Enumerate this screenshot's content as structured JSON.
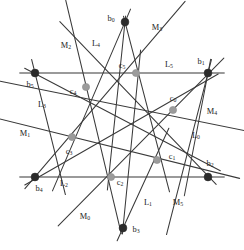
{
  "figure": {
    "colors": {
      "background": "#ffffff",
      "dark_line": "#3a3a3a",
      "gray_line": "#9a9a9a",
      "black_node": "#2b2b2b",
      "gray_node": "#9b9b9b",
      "label_text": "#232323"
    },
    "width": 244,
    "height": 250
  },
  "black_points": [
    {
      "id": "b0",
      "base": "b",
      "sub": "0",
      "x": 125,
      "y": 22,
      "label_x": 111,
      "label_y": 19
    },
    {
      "id": "b1",
      "base": "b",
      "sub": "1",
      "x": 208,
      "y": 73,
      "label_x": 201,
      "label_y": 62
    },
    {
      "id": "b2",
      "base": "b",
      "sub": "2",
      "x": 208,
      "y": 177,
      "label_x": 210,
      "label_y": 164
    },
    {
      "id": "b3",
      "base": "b",
      "sub": "3",
      "x": 123,
      "y": 228,
      "label_x": 136,
      "label_y": 230
    },
    {
      "id": "b4",
      "base": "b",
      "sub": "4",
      "x": 35,
      "y": 177,
      "label_x": 39,
      "label_y": 189
    },
    {
      "id": "b5",
      "base": "b",
      "sub": "5",
      "x": 35,
      "y": 73,
      "label_x": 30,
      "label_y": 85
    }
  ],
  "gray_points": [
    {
      "id": "c0",
      "base": "c",
      "sub": "0",
      "x": 173,
      "y": 110,
      "label_x": 173,
      "label_y": 99
    },
    {
      "id": "c1",
      "base": "c",
      "sub": "1",
      "x": 157,
      "y": 160,
      "label_x": 172,
      "label_y": 157
    },
    {
      "id": "c2",
      "base": "c",
      "sub": "2",
      "x": 111,
      "y": 177,
      "label_x": 120,
      "label_y": 183
    },
    {
      "id": "c3",
      "base": "c",
      "sub": "3",
      "x": 72,
      "y": 137,
      "label_x": 69,
      "label_y": 152
    },
    {
      "id": "c4",
      "base": "c",
      "sub": "4",
      "x": 86,
      "y": 87,
      "label_x": 73,
      "label_y": 92
    },
    {
      "id": "c5",
      "base": "c",
      "sub": "5",
      "x": 136,
      "y": 73,
      "label_x": 122,
      "label_y": 66
    }
  ],
  "lines": [
    {
      "id": "L0",
      "base": "L",
      "sub": "0",
      "x1": 208,
      "y1": 73,
      "x2": 187,
      "y2": 182,
      "color": "dark",
      "label_x": 196,
      "label_y": 136
    },
    {
      "id": "L1",
      "base": "L",
      "sub": "1",
      "x1": 123,
      "y1": 228,
      "x2": 163,
      "y2": 141,
      "color": "dark",
      "label_x": 148,
      "label_y": 203
    },
    {
      "id": "L2",
      "base": "L",
      "sub": "2",
      "x1": 20,
      "y1": 177,
      "x2": 224,
      "y2": 177,
      "color": "gray",
      "label_x": 64,
      "label_y": 184
    },
    {
      "id": "L3",
      "base": "L",
      "sub": "3",
      "x1": 35,
      "y1": 73,
      "x2": 62,
      "y2": 181,
      "color": "dark",
      "label_x": 42,
      "label_y": 105
    },
    {
      "id": "L4",
      "base": "L",
      "sub": "4",
      "x1": 125,
      "y1": 22,
      "x2": 58,
      "y2": 178,
      "color": "dark",
      "label_x": 96,
      "label_y": 44
    },
    {
      "id": "L5",
      "base": "L",
      "sub": "5",
      "x1": 20,
      "y1": 73,
      "x2": 224,
      "y2": 73,
      "color": "gray",
      "label_x": 169,
      "label_y": 65
    },
    {
      "id": "M0",
      "base": "M",
      "sub": "0",
      "x1": 68,
      "y1": 216,
      "x2": 214,
      "y2": 68,
      "color": "dark",
      "label_x": 85,
      "label_y": 217
    },
    {
      "id": "M1",
      "base": "M",
      "sub": "1",
      "x1": 12,
      "y1": 122,
      "x2": 226,
      "y2": 175,
      "color": "dark",
      "label_x": 25,
      "label_y": 134
    },
    {
      "id": "M2",
      "base": "M",
      "sub": "2",
      "x1": 69,
      "y1": 14,
      "x2": 118,
      "y2": 220,
      "color": "dark",
      "label_x": 66,
      "label_y": 46
    },
    {
      "id": "M3",
      "base": "M",
      "sub": "3",
      "x1": 176,
      "y1": 12,
      "x2": 34,
      "y2": 178,
      "color": "dark",
      "label_x": 157,
      "label_y": 28
    },
    {
      "id": "M4",
      "base": "M",
      "sub": "4",
      "x1": 14,
      "y1": 84,
      "x2": 232,
      "y2": 128,
      "color": "dark",
      "label_x": 212,
      "label_y": 112
    },
    {
      "id": "M5",
      "base": "M",
      "sub": "5",
      "x1": 208,
      "y1": 73,
      "x2": 170,
      "y2": 221,
      "color": "dark",
      "label_x": 178,
      "label_y": 203
    }
  ],
  "extra_segments": [
    {
      "id": "seg-b0-c2",
      "x1": 125,
      "y1": 22,
      "x2": 108,
      "y2": 184
    },
    {
      "id": "seg-b0-c1",
      "x1": 125,
      "y1": 22,
      "x2": 168,
      "y2": 186
    },
    {
      "id": "seg-b5-c1",
      "x1": 30,
      "y1": 71,
      "x2": 215,
      "y2": 168
    },
    {
      "id": "seg-b3-c5",
      "x1": 123,
      "y1": 228,
      "x2": 140,
      "y2": 56
    },
    {
      "id": "seg-b1-c3",
      "x1": 213,
      "y1": 77,
      "x2": 30,
      "y2": 182
    },
    {
      "id": "seg-b2-c4",
      "x1": 212,
      "y1": 180,
      "x2": 64,
      "y2": 26
    }
  ]
}
